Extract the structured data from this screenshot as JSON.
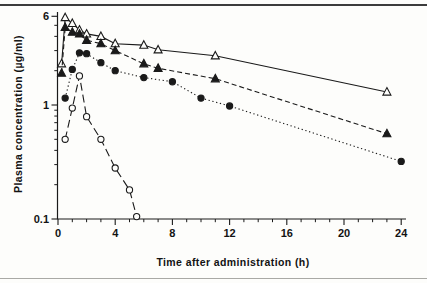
{
  "figure": {
    "background_color": "#fdfdfb",
    "foreground_color": "#1a1a1a",
    "top_rule": true,
    "bottom_rule": true
  },
  "chart_data": {
    "type": "line",
    "title": "",
    "xlabel": "Time after administration (h)",
    "ylabel": "Plasma concentration (µg/ml)",
    "x_axis": {
      "min": 0,
      "max": 24.4,
      "major_ticks": [
        0,
        4,
        8,
        12,
        16,
        20,
        24
      ],
      "minor_tick_interval": 1,
      "scale": "linear"
    },
    "y_axis": {
      "scale": "log",
      "min": 0.1,
      "max": 6.5,
      "labeled_ticks": [
        6,
        1,
        0.1
      ],
      "minor_ticks": [
        0.2,
        0.3,
        0.4,
        0.5,
        0.6,
        0.7,
        0.8,
        0.9,
        2,
        3,
        4,
        5
      ]
    },
    "grid": false,
    "legend": "none",
    "series": [
      {
        "name": "open-triangle-formulation",
        "marker": "triangle-open",
        "line": "solid",
        "points": [
          [
            0.25,
            2.3
          ],
          [
            0.5,
            5.85
          ],
          [
            1,
            5.2
          ],
          [
            1.5,
            4.55
          ],
          [
            2,
            4.2
          ],
          [
            3,
            4.0
          ],
          [
            4,
            3.45
          ],
          [
            6,
            3.35
          ],
          [
            7,
            3.05
          ],
          [
            11,
            2.7
          ],
          [
            23,
            1.3
          ]
        ]
      },
      {
        "name": "filled-triangle-formulation",
        "marker": "triangle-filled",
        "line": "dashed",
        "points": [
          [
            0.25,
            1.9
          ],
          [
            0.5,
            4.8
          ],
          [
            1,
            4.35
          ],
          [
            1.5,
            4.2
          ],
          [
            2,
            3.7
          ],
          [
            3,
            3.45
          ],
          [
            4,
            3.0
          ],
          [
            6,
            2.3
          ],
          [
            7,
            2.1
          ],
          [
            11,
            1.7
          ],
          [
            23,
            0.56
          ]
        ]
      },
      {
        "name": "filled-circle-formulation",
        "marker": "circle-filled",
        "line": "dotted",
        "points": [
          [
            0.5,
            1.15
          ],
          [
            1,
            2.05
          ],
          [
            1.5,
            2.87
          ],
          [
            2,
            2.82
          ],
          [
            3,
            2.35
          ],
          [
            4,
            2.0
          ],
          [
            6,
            1.74
          ],
          [
            8,
            1.6
          ],
          [
            10,
            1.15
          ],
          [
            12,
            0.98
          ],
          [
            24,
            0.32
          ]
        ]
      },
      {
        "name": "open-circle-formulation",
        "marker": "circle-open",
        "line": "longdash",
        "points": [
          [
            0.5,
            0.5
          ],
          [
            1,
            0.94
          ],
          [
            1.5,
            1.8
          ],
          [
            2,
            0.79
          ],
          [
            3,
            0.5
          ],
          [
            4,
            0.28
          ],
          [
            5,
            0.18
          ],
          [
            5.5,
            0.105
          ]
        ]
      }
    ]
  }
}
